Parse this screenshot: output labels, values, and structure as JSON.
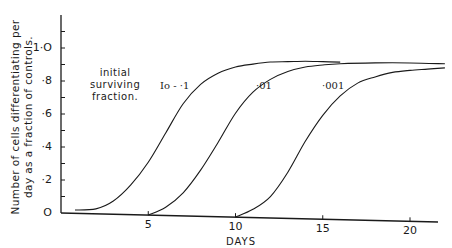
{
  "chart_data": {
    "type": "line",
    "title": "",
    "xlabel": "DAYS",
    "ylabel": "Number of cells differentiating per day as a fraction of controls.",
    "ylabel_lines": [
      "Number of cells differentiating per",
      "day as a fraction of controls."
    ],
    "xlim": [
      0,
      22
    ],
    "ylim": [
      0,
      1.15
    ],
    "xticks": [
      5,
      10,
      15,
      20
    ],
    "xtick_labels": [
      "5",
      "10",
      "15",
      "20"
    ],
    "yticks": [
      0,
      0.2,
      0.4,
      0.6,
      0.8,
      1.0
    ],
    "ytick_labels": [
      "O",
      "·2",
      "·4",
      "·6",
      "·8",
      "1·O"
    ],
    "grid": false,
    "legend": "inline annotations",
    "annotation": [
      "initial",
      "surviving",
      "fraction."
    ],
    "series": [
      {
        "name": "Io = ·1",
        "x": [
          0.8,
          2,
          3,
          4,
          5,
          6,
          7,
          8,
          9,
          10,
          11,
          12,
          13,
          14,
          15,
          16
        ],
        "y": [
          0.02,
          0.03,
          0.08,
          0.18,
          0.32,
          0.5,
          0.68,
          0.8,
          0.87,
          0.91,
          0.93,
          0.945,
          0.95,
          0.955,
          0.955,
          0.955
        ]
      },
      {
        "name": "·01",
        "x": [
          5,
          6,
          7,
          8,
          9,
          10,
          11,
          12,
          13,
          14,
          15,
          16,
          18,
          20,
          22
        ],
        "y": [
          0.0,
          0.05,
          0.14,
          0.28,
          0.45,
          0.63,
          0.76,
          0.84,
          0.89,
          0.92,
          0.935,
          0.945,
          0.955,
          0.96,
          0.96
        ]
      },
      {
        "name": "·001",
        "x": [
          10,
          11,
          12,
          13,
          14,
          15,
          16,
          17,
          18,
          19,
          20,
          21,
          22
        ],
        "y": [
          0.0,
          0.05,
          0.13,
          0.28,
          0.47,
          0.63,
          0.75,
          0.83,
          0.87,
          0.9,
          0.915,
          0.925,
          0.935
        ]
      }
    ],
    "series_labels": [
      "Io - ·1",
      "·01",
      "·001"
    ]
  }
}
